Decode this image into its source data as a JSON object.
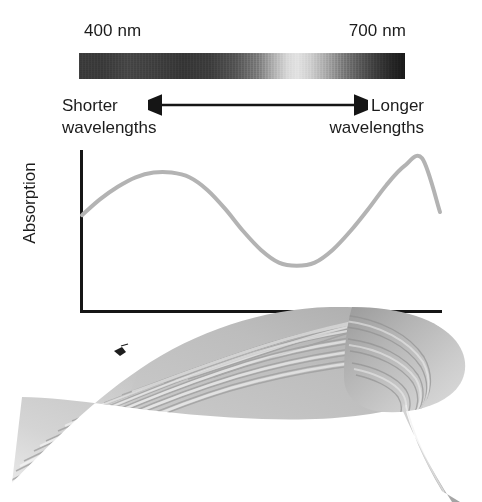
{
  "figure": {
    "background_color": "#ffffff"
  },
  "spectrum": {
    "min_label": "400 nm",
    "max_label": "700 nm",
    "bar_name": "visible-spectrum-bar",
    "rendering": "grayscale"
  },
  "direction": {
    "left_label": "Shorter\nwavelengths",
    "left_label_line1": "Shorter",
    "left_label_line2": "wavelengths",
    "right_label_line1": "Longer",
    "right_label_line2": "wavelengths",
    "arrow_style": "double-headed",
    "arrow_color": "#151515"
  },
  "plot": {
    "y_axis_label": "Absorption",
    "x_axis_label": "",
    "axis_color": "#151515",
    "curve_color": "#b3b3b3",
    "curve_width": 4
  },
  "chart_data": {
    "type": "line",
    "title": "Absorption",
    "xlabel": "Wavelength (nm)",
    "ylabel": "Absorption",
    "xlim": [
      400,
      700
    ],
    "ylim": [
      0,
      1
    ],
    "grid": false,
    "legend": "none",
    "x_tick_labels": [
      "400 nm",
      "700 nm"
    ],
    "series": [
      {
        "name": "Chlorophyll absorption",
        "x": [
          400,
          415,
          430,
          445,
          460,
          475,
          490,
          505,
          520,
          535,
          550,
          565,
          580,
          595,
          610,
          625,
          640,
          655,
          670,
          685,
          700
        ],
        "values": [
          0.6,
          0.7,
          0.78,
          0.84,
          0.87,
          0.87,
          0.84,
          0.76,
          0.64,
          0.5,
          0.38,
          0.3,
          0.28,
          0.3,
          0.38,
          0.5,
          0.64,
          0.79,
          0.91,
          0.96,
          0.62
        ]
      }
    ],
    "annotations": [
      {
        "text": "Shorter wavelengths",
        "position": "left"
      },
      {
        "text": "Longer wavelengths",
        "position": "right"
      }
    ]
  },
  "leaf": {
    "name": "hosta-leaf-photo",
    "description": "Grayscale photograph of a broad leaf with parallel venation and a petiole",
    "rendering": "grayscale"
  }
}
